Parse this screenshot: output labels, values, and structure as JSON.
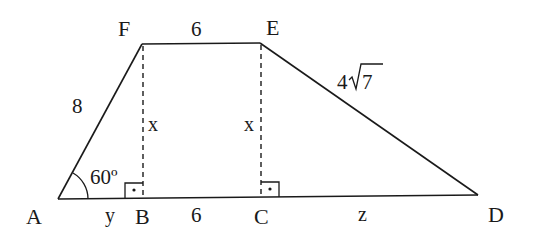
{
  "diagram": {
    "type": "trapezoid",
    "vertices": {
      "A": "A",
      "B": "B",
      "C": "C",
      "D": "D",
      "E": "E",
      "F": "F"
    },
    "labels": {
      "AF": "8",
      "FE": "6",
      "ED_coef": "4",
      "ED_radicand": "7",
      "FB": "x",
      "EC": "x",
      "AB": "y",
      "BC": "6",
      "CD": "z",
      "angle_A": "60º"
    },
    "right_angles": [
      "B",
      "C"
    ],
    "colors": {
      "stroke": "#1a1a1a",
      "background": "#ffffff"
    }
  }
}
